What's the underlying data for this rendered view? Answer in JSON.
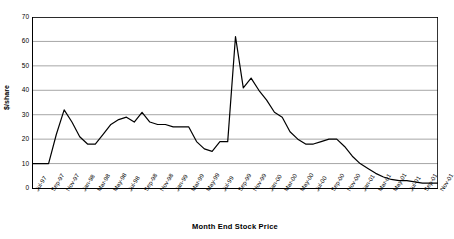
{
  "chart_data": {
    "type": "line",
    "title": "",
    "xlabel": "Month End Stock Price",
    "ylabel": "$/share",
    "ylim": [
      0,
      70
    ],
    "ytick_values": [
      0,
      10,
      20,
      30,
      40,
      50,
      60,
      70
    ],
    "ytick_labels": [
      "0",
      "10",
      "20",
      "30",
      "40",
      "50",
      "60",
      "70"
    ],
    "grid": true,
    "grid_axis": "y",
    "legend": false,
    "legend_position": "none",
    "line_color": "#000000",
    "background_color": "#ffffff",
    "axis_color": "#000000",
    "grid_color": "#808080",
    "x": [
      "Jul-97",
      "Aug-97",
      "Sep-97",
      "Oct-97",
      "Nov-97",
      "Dec-97",
      "Jan-98",
      "Feb-98",
      "Mar-98",
      "Apr-98",
      "May-98",
      "Jun-98",
      "Jul-98",
      "Aug-98",
      "Sep-98",
      "Oct-98",
      "Nov-98",
      "Dec-98",
      "Jan-99",
      "Feb-99",
      "Mar-99",
      "Apr-99",
      "May-99",
      "Jun-99",
      "Jul-99",
      "Aug-99",
      "Sep-99",
      "Oct-99",
      "Nov-99",
      "Dec-99",
      "Jan-00",
      "Feb-00",
      "Mar-00",
      "Apr-00",
      "May-00",
      "Jun-00",
      "Jul-00",
      "Aug-00",
      "Sep-00",
      "Oct-00",
      "Nov-00",
      "Dec-00",
      "Jan-01",
      "Feb-01",
      "Mar-01",
      "Apr-01",
      "May-01",
      "Jun-01",
      "Jul-01",
      "Aug-01",
      "Sep-01",
      "Oct-01",
      "Nov-01"
    ],
    "xtick_labels": [
      "Jul-97",
      "Sep-97",
      "Nov-97",
      "Jan-98",
      "Mar-98",
      "May-98",
      "Jul-98",
      "Sep-98",
      "Nov-98",
      "Jan-99",
      "Mar-99",
      "May-99",
      "Jul-99",
      "Sep-99",
      "Nov-99",
      "Jan-00",
      "Mar-00",
      "May-00",
      "Jul-00",
      "Sep-00",
      "Nov-00",
      "Jan-01",
      "Mar-01",
      "May-01",
      "Jul-01",
      "Sep-01",
      "Nov-01"
    ],
    "values": [
      10,
      10,
      10,
      22,
      32,
      27,
      21,
      18,
      18,
      22,
      26,
      28,
      29,
      27,
      31,
      27,
      26,
      26,
      25,
      25,
      25,
      19,
      16,
      15,
      19,
      19,
      62,
      41,
      45,
      40,
      36,
      31,
      29,
      23,
      20,
      18,
      18,
      19,
      20,
      20,
      17,
      13,
      10,
      8,
      6,
      4.5,
      3.5,
      3,
      3,
      2.5,
      2,
      2,
      2
    ],
    "series_name": "Month End Stock Price"
  }
}
